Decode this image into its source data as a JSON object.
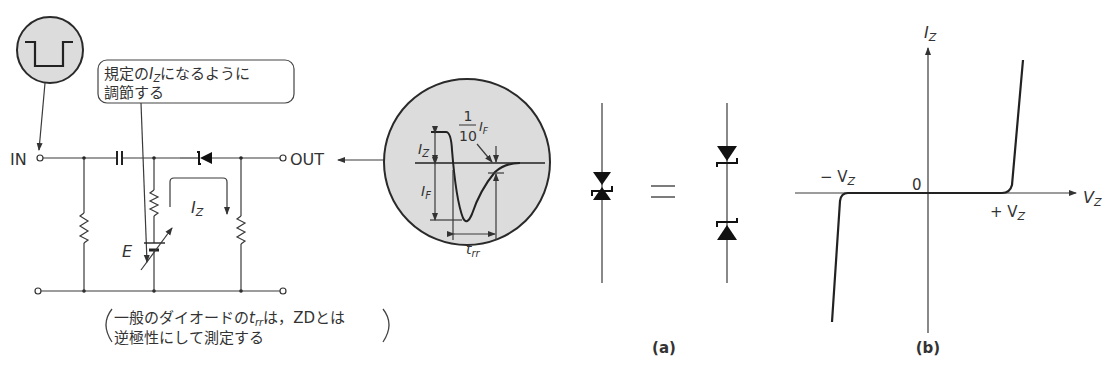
{
  "circuit": {
    "input_label": "IN",
    "output_label": "OUT",
    "callout_line1_pre": "規定の",
    "callout_line1_var": "I",
    "callout_line1_sub": "Z",
    "callout_line1_post": "になるように",
    "callout_line2": "調節する",
    "source_label": "E",
    "current_label": "I",
    "current_sub": "Z",
    "note_line1_pre": "一般のダイオードの",
    "note_line1_var": "t",
    "note_line1_sub": "rr",
    "note_line1_post": "は，ZDとは",
    "note_line2": "逆極性にして測定する"
  },
  "waveform": {
    "iz_label": "I",
    "iz_sub": "Z",
    "if_label": "I",
    "if_sub": "F",
    "fraction_num": "1",
    "fraction_den": "10",
    "fraction_var": "I",
    "fraction_sub": "F",
    "trr_label": "t",
    "trr_sub": "rr"
  },
  "figure_a": {
    "equals": "=",
    "caption": "(a)"
  },
  "figure_b": {
    "y_axis": "I",
    "y_axis_sub": "Z",
    "x_axis": "V",
    "x_axis_sub": "Z",
    "origin": "0",
    "neg_vz": "− V",
    "neg_vz_sub": "Z",
    "pos_vz": "+ V",
    "pos_vz_sub": "Z",
    "caption": "(b)"
  }
}
